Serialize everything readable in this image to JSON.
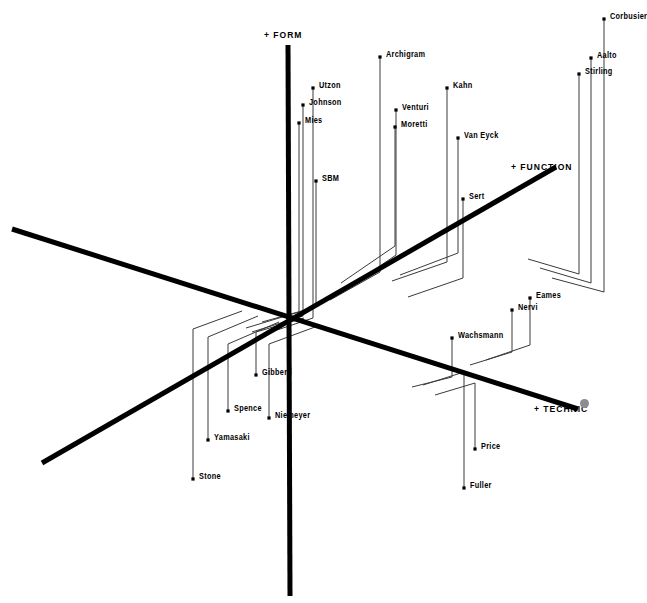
{
  "figure": {
    "background": "#ffffff",
    "ink": "#000000",
    "thin_ink": "#3a3a3a",
    "cursor_color": "#8d8d8d"
  },
  "axes": [
    {
      "id": "form",
      "label": "+ FORM",
      "label_x": 264,
      "label_y": 29,
      "x1": 288,
      "y1": 45,
      "x2": 290,
      "y2": 596,
      "width": 5
    },
    {
      "id": "function",
      "label": "+ FUNCTION",
      "label_x": 511,
      "label_y": 161,
      "x1": 42,
      "y1": 463,
      "x2": 556,
      "y2": 167,
      "width": 5
    },
    {
      "id": "technic",
      "label": "+ TECHNIC",
      "label_x": 534,
      "label_y": 403,
      "x1": 12,
      "y1": 229,
      "x2": 578,
      "y2": 409,
      "width": 5
    }
  ],
  "cursor": {
    "x": 584,
    "y": 403,
    "name": "pointer-dot"
  },
  "chart_data": {
    "type": "scatter",
    "title": "",
    "xlabel": "+ TECHNIC",
    "ylabel": "+ FORM",
    "zlabel": "+ FUNCTION",
    "projection": "axonometric-3d",
    "grid": false,
    "legend": "none",
    "points": [
      {
        "name": "Corbusier",
        "px": 604,
        "py": 19,
        "lx": 610,
        "ly": 16,
        "drop_y": 292,
        "conn_x": 552,
        "conn_y": 278
      },
      {
        "name": "Aalto",
        "px": 591,
        "py": 58,
        "lx": 597,
        "ly": 55,
        "drop_y": 283,
        "conn_x": 540,
        "conn_y": 268
      },
      {
        "name": "Stirling",
        "px": 579,
        "py": 74,
        "lx": 585,
        "ly": 71,
        "drop_y": 274,
        "conn_x": 528,
        "conn_y": 259
      },
      {
        "name": "Archigram",
        "px": 380,
        "py": 57,
        "lx": 386,
        "ly": 54,
        "drop_y": 272,
        "conn_x": 330,
        "conn_y": 300
      },
      {
        "name": "Kahn",
        "px": 447,
        "py": 88,
        "lx": 453,
        "ly": 85,
        "drop_y": 262,
        "conn_x": 392,
        "conn_y": 281
      },
      {
        "name": "Utzon",
        "px": 313,
        "py": 88,
        "lx": 319,
        "ly": 85,
        "drop_y": 318,
        "conn_x": 262,
        "conn_y": 335
      },
      {
        "name": "Venturi",
        "px": 396,
        "py": 110,
        "lx": 402,
        "ly": 107,
        "drop_y": 255,
        "conn_x": 345,
        "conn_y": 290
      },
      {
        "name": "Johnson",
        "px": 303,
        "py": 105,
        "lx": 309,
        "ly": 102,
        "drop_y": 316,
        "conn_x": 252,
        "conn_y": 332
      },
      {
        "name": "Moretti",
        "px": 395,
        "py": 127,
        "lx": 401,
        "ly": 124,
        "drop_y": 246,
        "conn_x": 341,
        "conn_y": 283
      },
      {
        "name": "Van Eyck",
        "px": 458,
        "py": 138,
        "lx": 464,
        "ly": 135,
        "drop_y": 253,
        "conn_x": 400,
        "conn_y": 275
      },
      {
        "name": "Mies",
        "px": 299,
        "py": 123,
        "lx": 305,
        "ly": 120,
        "drop_y": 312,
        "conn_x": 246,
        "conn_y": 328
      },
      {
        "name": "SBM",
        "px": 316,
        "py": 181,
        "lx": 322,
        "ly": 178,
        "drop_y": 307,
        "conn_x": 262,
        "conn_y": 322
      },
      {
        "name": "Sert",
        "px": 463,
        "py": 199,
        "lx": 469,
        "ly": 196,
        "drop_y": 278,
        "conn_x": 408,
        "conn_y": 297
      },
      {
        "name": "Eames",
        "px": 530,
        "py": 298,
        "lx": 536,
        "ly": 295,
        "drop_y": 345,
        "conn_x": 486,
        "conn_y": 360
      },
      {
        "name": "Nervi",
        "px": 512,
        "py": 310,
        "lx": 518,
        "ly": 307,
        "drop_y": 352,
        "conn_x": 470,
        "conn_y": 365
      },
      {
        "name": "Wachsmann",
        "px": 452,
        "py": 338,
        "lx": 458,
        "ly": 335,
        "drop_y": 377,
        "conn_x": 412,
        "conn_y": 387
      },
      {
        "name": "Gibberd",
        "px": 256,
        "py": 375,
        "lx": 262,
        "ly": 372,
        "drop_y": 332,
        "conn_x": 304,
        "conn_y": 318
      },
      {
        "name": "Niemeyer",
        "px": 269,
        "py": 418,
        "lx": 275,
        "ly": 415,
        "drop_y": 344,
        "conn_x": 315,
        "conn_y": 327
      },
      {
        "name": "Spence",
        "px": 228,
        "py": 411,
        "lx": 234,
        "ly": 408,
        "drop_y": 344,
        "conn_x": 279,
        "conn_y": 322
      },
      {
        "name": "Price",
        "px": 475,
        "py": 449,
        "lx": 481,
        "ly": 446,
        "drop_y": 383,
        "conn_x": 435,
        "conn_y": 395
      },
      {
        "name": "Yamasaki",
        "px": 208,
        "py": 440,
        "lx": 214,
        "ly": 437,
        "drop_y": 337,
        "conn_x": 258,
        "conn_y": 316
      },
      {
        "name": "Fuller",
        "px": 464,
        "py": 488,
        "lx": 470,
        "ly": 485,
        "drop_y": 372,
        "conn_x": 423,
        "conn_y": 385
      },
      {
        "name": "Stone",
        "px": 193,
        "py": 479,
        "lx": 199,
        "ly": 476,
        "drop_y": 329,
        "conn_x": 242,
        "conn_y": 311
      }
    ]
  }
}
